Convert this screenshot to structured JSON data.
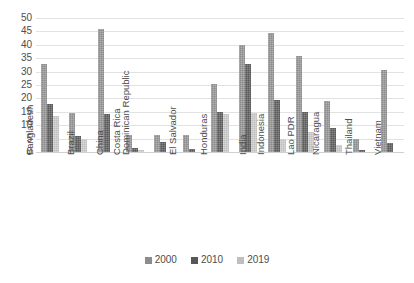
{
  "chart_data": {
    "type": "bar",
    "title": "",
    "subtitle": "",
    "xlabel": "",
    "ylabel": "",
    "ylim": [
      0,
      50
    ],
    "ytick_step": 5,
    "yticks": [
      50,
      45,
      40,
      35,
      30,
      25,
      20,
      15,
      10,
      5,
      0
    ],
    "grid": true,
    "legend_position": "bottom",
    "categories": [
      "Bangladesh",
      "Brazil",
      "China",
      "Costa Rica",
      "Dominican Republic",
      "El Salvador",
      "Honduras",
      "India",
      "Indonesia",
      "Lao PDR",
      "Nicaragua",
      "Thailand",
      "Vietnam"
    ],
    "series": [
      {
        "name": "2000",
        "color": "#8c8c8c",
        "values": [
          33,
          14.7,
          46,
          6.5,
          6.3,
          6.5,
          25.5,
          40,
          44.5,
          36,
          19,
          5,
          30.5
        ]
      },
      {
        "name": "2010",
        "color": "#585858",
        "values": [
          18,
          6,
          14,
          1.5,
          3.8,
          1.3,
          15,
          33,
          19.5,
          15,
          9,
          0.8,
          3.5
        ]
      },
      {
        "name": "2019",
        "color": "#bfbfbf",
        "values": [
          13.5,
          5,
          0,
          0.8,
          0,
          0,
          14,
          14.5,
          5,
          7.5,
          2.5,
          0,
          0
        ]
      }
    ]
  },
  "legend": {
    "items": [
      {
        "label": "2000"
      },
      {
        "label": "2010"
      },
      {
        "label": "2019"
      }
    ]
  }
}
